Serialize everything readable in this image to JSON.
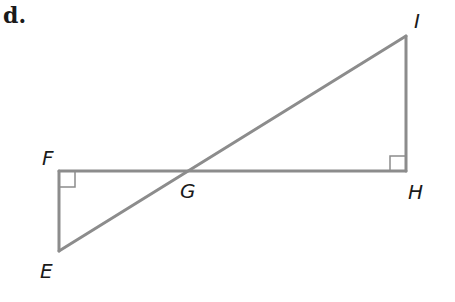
{
  "problem": {
    "label": "d."
  },
  "diagram": {
    "stroke_color": "#8c8c8c",
    "label_color": "#1a1a1a",
    "points": {
      "E": {
        "label": "E",
        "x": 59,
        "y": 251
      },
      "F": {
        "label": "F",
        "x": 59,
        "y": 171
      },
      "G": {
        "label": "G",
        "x": 189,
        "y": 171
      },
      "H": {
        "label": "H",
        "x": 406,
        "y": 171
      },
      "I": {
        "label": "I",
        "x": 406,
        "y": 36
      }
    },
    "segments": [
      "EF",
      "FH",
      "HI",
      "EI"
    ],
    "right_angles": [
      "F",
      "H"
    ]
  }
}
